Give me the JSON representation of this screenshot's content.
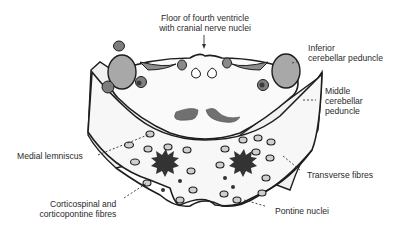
{
  "diagram": {
    "labels": {
      "floor_fourth_ventricle": [
        "Floor of fourth ventricle",
        "with cranial nerve nuclei"
      ],
      "inferior_cerebellar_peduncle": [
        "Inferior",
        "cerebellar peduncle"
      ],
      "middle_cerebellar_peduncle": [
        "Middle",
        "cerebellar",
        "peduncle"
      ],
      "medial_lemniscus": [
        "Medial lemniscus"
      ],
      "transverse_fibres": [
        "Transverse fibres"
      ],
      "corticospinal_fibres": [
        "Corticospinal and",
        "corticopontine fibres"
      ],
      "pontine_nuclei": [
        "Pontine nuclei"
      ]
    },
    "colors": {
      "outline": "#1e1e1e",
      "peduncle_fill": "#a8a8a8",
      "lemniscus_fill": "#6e6e6e",
      "tract_fill": "#3a3a3a",
      "body_fill": "#f6f6f6",
      "nuclei_fill": "#c9c9c9"
    }
  }
}
